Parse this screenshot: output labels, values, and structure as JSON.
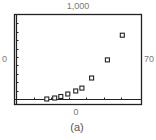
{
  "chart_data": {
    "type": "scatter",
    "title": "",
    "caption": "(a)",
    "xlabel": "",
    "ylabel": "",
    "window": {
      "xmin_label": "0",
      "xmax_label": "70",
      "ymin_label": "0",
      "ymax_label": "1,000"
    },
    "xlim": [
      0,
      70
    ],
    "ylim": [
      0,
      1000
    ],
    "x_tick_step": 10,
    "y_tick_step": 100,
    "grid": false,
    "legend": null,
    "marker": "hollow-square",
    "series": [
      {
        "name": "data",
        "points": [
          {
            "x": 17.5,
            "y": 0
          },
          {
            "x": 22,
            "y": 12
          },
          {
            "x": 25.5,
            "y": 30
          },
          {
            "x": 29.5,
            "y": 60
          },
          {
            "x": 34,
            "y": 95
          },
          {
            "x": 37.5,
            "y": 130
          },
          {
            "x": 43,
            "y": 250
          },
          {
            "x": 52,
            "y": 465
          },
          {
            "x": 60.5,
            "y": 760
          }
        ]
      }
    ],
    "colors": {
      "frame": "#222222",
      "marker": "#222222",
      "label": "#7a7a7a",
      "background": "#ffffff"
    }
  }
}
